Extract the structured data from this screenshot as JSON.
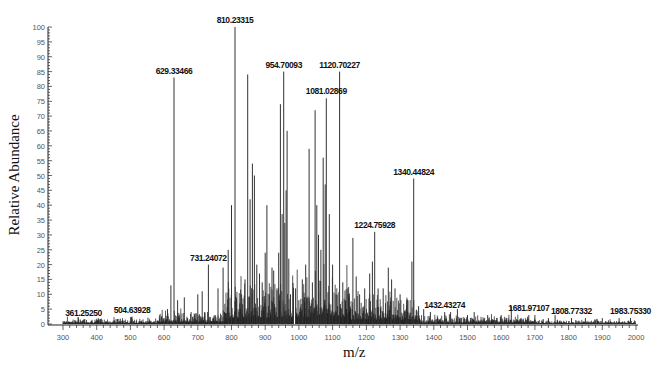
{
  "chart_data": {
    "type": "bar",
    "subtype": "mass-spectrum-stick",
    "title": "",
    "xlabel": "m/z",
    "ylabel": "Relative Abundance",
    "xlim": [
      270,
      2010
    ],
    "ylim": [
      0,
      100
    ],
    "x_ticks": [
      300,
      400,
      500,
      600,
      700,
      800,
      900,
      1000,
      1100,
      1200,
      1300,
      1400,
      1500,
      1600,
      1700,
      1800,
      1900,
      2000
    ],
    "y_ticks": [
      0,
      5,
      10,
      15,
      20,
      25,
      30,
      35,
      40,
      45,
      50,
      55,
      60,
      65,
      70,
      75,
      80,
      85,
      90,
      95,
      100
    ],
    "grid": false,
    "legend": null,
    "labeled_peaks": [
      {
        "mz": 361.2525,
        "label": "361.25250",
        "intensity": 1.5
      },
      {
        "mz": 504.63928,
        "label": "504.63928",
        "intensity": 2.5
      },
      {
        "mz": 629.33466,
        "label": "629.33466",
        "intensity": 83
      },
      {
        "mz": 731.24072,
        "label": "731.24072",
        "intensity": 20
      },
      {
        "mz": 810.23315,
        "label": "810.23315",
        "intensity": 100
      },
      {
        "mz": 954.70093,
        "label": "954.70093",
        "intensity": 85
      },
      {
        "mz": 1081.02869,
        "label": "1081.02869",
        "intensity": 76
      },
      {
        "mz": 1120.70227,
        "label": "1120.70227",
        "intensity": 85
      },
      {
        "mz": 1224.75928,
        "label": "1224.75928",
        "intensity": 31
      },
      {
        "mz": 1340.44824,
        "label": "1340.44824",
        "intensity": 49
      },
      {
        "mz": 1432.43274,
        "label": "1432.43274",
        "intensity": 4
      },
      {
        "mz": 1681.97107,
        "label": "1681.97107",
        "intensity": 3
      },
      {
        "mz": 1808.77332,
        "label": "1808.77332",
        "intensity": 2
      },
      {
        "mz": 1983.7533,
        "label": "1983.75330",
        "intensity": 2
      }
    ],
    "other_peaks": [
      [
        610,
        5
      ],
      [
        620,
        13
      ],
      [
        640,
        8
      ],
      [
        660,
        9
      ],
      [
        680,
        4
      ],
      [
        700,
        10
      ],
      [
        713,
        11
      ],
      [
        720,
        4
      ],
      [
        760,
        12
      ],
      [
        775,
        19
      ],
      [
        790,
        25
      ],
      [
        800,
        40
      ],
      [
        815,
        8
      ],
      [
        830,
        10
      ],
      [
        840,
        15
      ],
      [
        848,
        84
      ],
      [
        855,
        42
      ],
      [
        862,
        54
      ],
      [
        868,
        50
      ],
      [
        875,
        20
      ],
      [
        883,
        17
      ],
      [
        891,
        14
      ],
      [
        900,
        24
      ],
      [
        905,
        40
      ],
      [
        912,
        10
      ],
      [
        920,
        19
      ],
      [
        925,
        18
      ],
      [
        935,
        12
      ],
      [
        940,
        24
      ],
      [
        945,
        74
      ],
      [
        950,
        37
      ],
      [
        958,
        34
      ],
      [
        962,
        45
      ],
      [
        965,
        65
      ],
      [
        970,
        22
      ],
      [
        975,
        10
      ],
      [
        990,
        12
      ],
      [
        1000,
        8
      ],
      [
        1010,
        15
      ],
      [
        1020,
        20
      ],
      [
        1030,
        59
      ],
      [
        1040,
        14
      ],
      [
        1048,
        72
      ],
      [
        1053,
        40
      ],
      [
        1058,
        30
      ],
      [
        1065,
        25
      ],
      [
        1072,
        56
      ],
      [
        1078,
        47
      ],
      [
        1090,
        37
      ],
      [
        1100,
        20
      ],
      [
        1110,
        10
      ],
      [
        1130,
        14
      ],
      [
        1145,
        12
      ],
      [
        1160,
        29
      ],
      [
        1170,
        16
      ],
      [
        1180,
        10
      ],
      [
        1195,
        12
      ],
      [
        1210,
        17
      ],
      [
        1218,
        21
      ],
      [
        1235,
        12
      ],
      [
        1250,
        12
      ],
      [
        1265,
        19
      ],
      [
        1275,
        15
      ],
      [
        1285,
        12
      ],
      [
        1300,
        10
      ],
      [
        1320,
        8
      ],
      [
        1335,
        21
      ],
      [
        1355,
        6
      ],
      [
        1370,
        5
      ],
      [
        1390,
        4
      ],
      [
        1450,
        4
      ],
      [
        1470,
        5
      ],
      [
        1500,
        3
      ],
      [
        1520,
        4
      ],
      [
        1560,
        3
      ],
      [
        1600,
        3
      ],
      [
        1630,
        6
      ],
      [
        1700,
        3
      ],
      [
        1740,
        2
      ],
      [
        1760,
        3
      ],
      [
        1850,
        2
      ],
      [
        1900,
        2
      ],
      [
        1950,
        2
      ]
    ],
    "noise_band": [
      {
        "from": 300,
        "to": 580,
        "level": 1.5
      },
      {
        "from": 580,
        "to": 780,
        "level": 3
      },
      {
        "from": 780,
        "to": 985,
        "level": 10
      },
      {
        "from": 990,
        "to": 1150,
        "level": 12
      },
      {
        "from": 1150,
        "to": 1360,
        "level": 7
      },
      {
        "from": 1360,
        "to": 1700,
        "level": 2
      },
      {
        "from": 1700,
        "to": 2000,
        "level": 1
      }
    ]
  },
  "colors": {
    "axis": "#222222",
    "peak": "#333333",
    "noise": "#111111",
    "label": "#111111",
    "tick_label": "#555555"
  }
}
